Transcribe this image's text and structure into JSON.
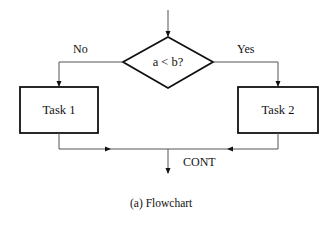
{
  "diagram": {
    "type": "flowchart",
    "decision": {
      "label": "a < b?"
    },
    "branches": {
      "no": {
        "label": "No",
        "target": "Task 1"
      },
      "yes": {
        "label": "Yes",
        "target": "Task 2"
      }
    },
    "tasks": [
      {
        "id": "task1",
        "label": "Task 1"
      },
      {
        "id": "task2",
        "label": "Task 2"
      }
    ],
    "merge": {
      "label": "CONT"
    },
    "caption": "(a)  Flowchart",
    "colors": {
      "stroke": "#111111",
      "connector": "#555555",
      "background": "#ffffff"
    }
  }
}
